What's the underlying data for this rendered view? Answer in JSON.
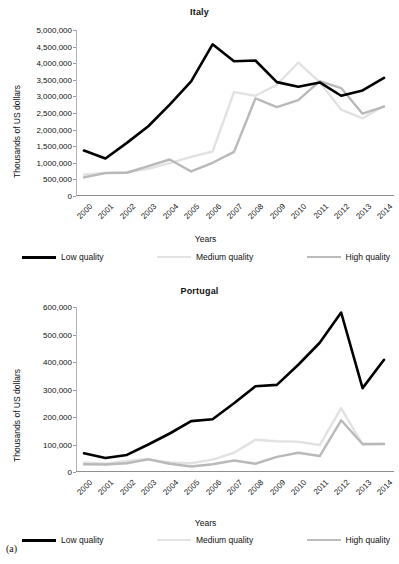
{
  "caption": "(a)",
  "legend": {
    "items": [
      {
        "label": "Low quality",
        "color": "#000000",
        "name": "low-quality"
      },
      {
        "label": "Medium quality",
        "color": "#e2e2e2",
        "name": "medium-quality"
      },
      {
        "label": "High quality",
        "color": "#b9b9b9",
        "name": "high-quality"
      }
    ]
  },
  "chart_data": [
    {
      "type": "line",
      "title": "Italy",
      "xlabel": "Years",
      "ylabel": "Thousands of US dollars",
      "x": [
        "2000",
        "2001",
        "2002",
        "2003",
        "2004",
        "2005",
        "2006",
        "2007",
        "2008",
        "2009",
        "2010",
        "2011",
        "2012",
        "2013",
        "2014"
      ],
      "ylim": [
        0,
        5000000
      ],
      "yticks": [
        0,
        500000,
        1000000,
        1500000,
        2000000,
        2500000,
        3000000,
        3500000,
        4000000,
        4500000,
        5000000
      ],
      "ytick_labels": [
        "0",
        "500,000",
        "1,000,000",
        "1,500,000",
        "2,000,000",
        "2,500,000",
        "3,000,000",
        "3,500,000",
        "4,000,000",
        "4,500,000",
        "5,000,000"
      ],
      "grid": false,
      "legend_position": "bottom",
      "series": [
        {
          "name": "Low quality",
          "color": "#000000",
          "values": [
            1370000,
            1130000,
            1600000,
            2100000,
            2750000,
            3450000,
            4570000,
            4060000,
            4080000,
            3430000,
            3290000,
            3420000,
            3020000,
            3180000,
            3560000
          ]
        },
        {
          "name": "Medium quality",
          "color": "#e2e2e2",
          "values": [
            640000,
            700000,
            720000,
            820000,
            990000,
            1180000,
            1340000,
            3130000,
            3020000,
            3350000,
            4020000,
            3430000,
            2600000,
            2340000,
            2710000
          ]
        },
        {
          "name": "High quality",
          "color": "#b9b9b9",
          "values": [
            560000,
            690000,
            700000,
            900000,
            1100000,
            740000,
            1000000,
            1330000,
            2940000,
            2680000,
            2890000,
            3460000,
            3250000,
            2480000,
            2690000
          ]
        }
      ]
    },
    {
      "type": "line",
      "title": "Portugal",
      "xlabel": "Years",
      "ylabel": "Thousands of US dollars",
      "x": [
        "2000",
        "2001",
        "2002",
        "2003",
        "2004",
        "2005",
        "2006",
        "2007",
        "2008",
        "2009",
        "2010",
        "2011",
        "2012",
        "2013",
        "2014"
      ],
      "ylim": [
        0,
        600000
      ],
      "yticks": [
        0,
        100000,
        200000,
        300000,
        400000,
        500000,
        600000
      ],
      "ytick_labels": [
        "0",
        "100,000",
        "200,000",
        "300,000",
        "400,000",
        "500,000",
        "600,000"
      ],
      "grid": false,
      "legend_position": "bottom",
      "series": [
        {
          "name": "Low quality",
          "color": "#000000",
          "values": [
            68000,
            51000,
            62000,
            100000,
            140000,
            185000,
            192000,
            250000,
            312000,
            317000,
            390000,
            470000,
            580000,
            305000,
            408000
          ]
        },
        {
          "name": "Medium quality",
          "color": "#e2e2e2",
          "values": [
            35000,
            30000,
            40000,
            47000,
            35000,
            32000,
            45000,
            70000,
            117000,
            112000,
            110000,
            98000,
            232000,
            100000,
            103000
          ]
        },
        {
          "name": "High quality",
          "color": "#b9b9b9",
          "values": [
            28000,
            27000,
            32000,
            46000,
            30000,
            20000,
            28000,
            42000,
            30000,
            55000,
            70000,
            58000,
            188000,
            102000,
            102000
          ]
        }
      ]
    }
  ]
}
